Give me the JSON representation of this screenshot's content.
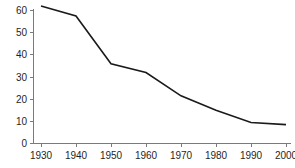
{
  "chart_data": {
    "type": "line",
    "title": "",
    "subtitle": "",
    "xlabel": "",
    "ylabel": "",
    "x": [
      1930,
      1940,
      1950,
      1960,
      1970,
      1980,
      1990,
      2000
    ],
    "categories": [
      "1930",
      "1940",
      "1950",
      "1960",
      "1970",
      "1980",
      "1990",
      "2000"
    ],
    "series": [
      {
        "name": "",
        "values": [
          62,
          57.5,
          36,
          32,
          21.5,
          15,
          9.5,
          8.5
        ],
        "color": "#1a1a1a"
      }
    ],
    "values": [
      62,
      57.5,
      36,
      32,
      21.5,
      15,
      9.5,
      8.5
    ],
    "xlim": [
      1930,
      2000
    ],
    "ylim": [
      0,
      60
    ],
    "x_ticks": [
      "1930",
      "1940",
      "1950",
      "1960",
      "1970",
      "1980",
      "1990",
      "2000"
    ],
    "y_ticks": [
      "0",
      "10",
      "20",
      "30",
      "40",
      "50",
      "60"
    ],
    "y_tick_values": [
      0,
      10,
      20,
      30,
      40,
      50,
      60
    ],
    "grid": false,
    "legend": false,
    "legend_position": "none",
    "annotations": [],
    "axis_color": "#7a7a7a",
    "line_color": "#1a1a1a",
    "background_color": "#ffffff"
  },
  "axes": {
    "y_labels": [
      "60",
      "50",
      "40",
      "30",
      "20",
      "10",
      "0"
    ],
    "x_labels": [
      "1930",
      "1940",
      "1950",
      "1960",
      "1970",
      "1980",
      "1990",
      "2000"
    ]
  }
}
